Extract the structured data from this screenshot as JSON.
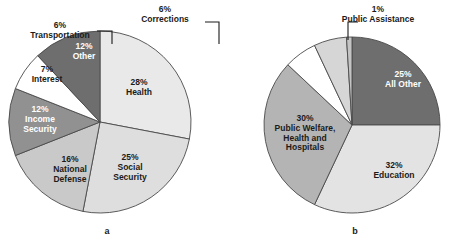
{
  "figure": {
    "background": "#ffffff",
    "captions": [
      {
        "text": "a",
        "x": 107,
        "y": 234
      },
      {
        "text": "b",
        "x": 355,
        "y": 234
      }
    ]
  },
  "chart_data": [
    {
      "type": "pie",
      "id": "federal-spending",
      "caption": "a",
      "title": "",
      "center": [
        100,
        122
      ],
      "radius": 91,
      "start_angle_deg": -90,
      "direction": "clockwise",
      "categories": [
        "Health",
        "Social Security",
        "National Defense",
        "Income Security",
        "Interest",
        "Other"
      ],
      "values": [
        28,
        25,
        16,
        12,
        7,
        12
      ],
      "value_labels": [
        "28%",
        "25%",
        "16%",
        "12%",
        "7%",
        "12%"
      ],
      "label_lines": [
        [
          "28%",
          "Health"
        ],
        [
          "25%",
          "Social",
          "Security"
        ],
        [
          "16%",
          "National",
          "Defense"
        ],
        [
          "12%",
          "Income",
          "Security"
        ],
        [
          "7%",
          "Interest"
        ],
        [
          "12%",
          "Other"
        ]
      ],
      "colors": [
        "#e9e9e9",
        "#dedede",
        "#c9c9c9",
        "#919191",
        "#ffffff",
        "#6e6e6e"
      ],
      "label_colors": [
        "#1b1b1b",
        "#1b1b1b",
        "#1b1b1b",
        "#ffffff",
        "#1b1b1b",
        "#ffffff"
      ],
      "label_positions": [
        [
          139,
          85
        ],
        [
          130,
          160
        ],
        [
          70,
          162
        ],
        [
          40,
          112
        ],
        [
          47,
          72
        ],
        [
          84,
          49
        ]
      ],
      "legend": "none",
      "grid": false
    },
    {
      "type": "pie",
      "id": "state-local-spending",
      "caption": "b",
      "title": "",
      "center": [
        352,
        125
      ],
      "radius": 88,
      "start_angle_deg": -90,
      "direction": "clockwise",
      "categories": [
        "All Other",
        "Education",
        "Public Welfare, Health and Hospitals",
        "Transportation",
        "Corrections",
        "Public Assistance"
      ],
      "values": [
        25,
        32,
        30,
        6,
        6,
        1
      ],
      "value_labels": [
        "25%",
        "32%",
        "30%",
        "6%",
        "6%",
        "1%"
      ],
      "label_lines": [
        [
          "25%",
          "All Other"
        ],
        [
          "32%",
          "Education"
        ],
        [
          "30%",
          "Public Welfare,",
          "Health and",
          "Hospitals"
        ],
        [
          "6%",
          "Transportation"
        ],
        [
          "6%",
          "Corrections"
        ],
        [
          "1%",
          "Public Assistance"
        ]
      ],
      "colors": [
        "#6e6e6e",
        "#e3e3e3",
        "#b4b4b4",
        "#ffffff",
        "#d6d6d6",
        "#c4c4c4"
      ],
      "label_colors": [
        "#ffffff",
        "#1b1b1b",
        "#1b1b1b",
        "#1b1b1b",
        "#1b1b1b",
        "#1b1b1b"
      ],
      "label_positions": [
        [
          403,
          77
        ],
        [
          394,
          168
        ],
        [
          305,
          121
        ],
        [
          60,
          28
        ],
        [
          165,
          12
        ],
        [
          378,
          12
        ]
      ],
      "callouts": [
        "Transportation",
        "Corrections",
        "Public Assistance"
      ],
      "legend": "none",
      "grid": false
    }
  ]
}
